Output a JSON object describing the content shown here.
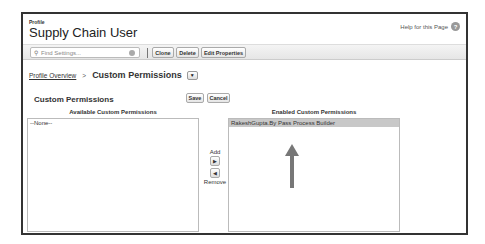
{
  "header": {
    "eyebrow": "Profile",
    "title": "Supply Chain User",
    "help_link": "Help for this Page",
    "help_icon": "?"
  },
  "toolbar": {
    "search_placeholder": "Find Settings...",
    "search_icon": "🔍",
    "buttons": [
      "Clone",
      "Delete",
      "Edit Properties"
    ]
  },
  "breadcrumb": {
    "link": "Profile Overview",
    "separator": ">",
    "current": "Custom Permissions",
    "dropdown_icon": "▼"
  },
  "section": {
    "title": "Custom Permissions",
    "save_label": "Save",
    "cancel_label": "Cancel"
  },
  "available": {
    "label": "Available Custom Permissions",
    "items": [
      "--None--"
    ]
  },
  "mover": {
    "add_label": "Add",
    "add_icon": "▶",
    "remove_icon": "◀",
    "remove_label": "Remove"
  },
  "enabled": {
    "label": "Enabled Custom Permissions",
    "items": [
      "RakeshGupta.By Pass Process Builder"
    ]
  },
  "annotation": {
    "arrow_color": "#777777"
  }
}
